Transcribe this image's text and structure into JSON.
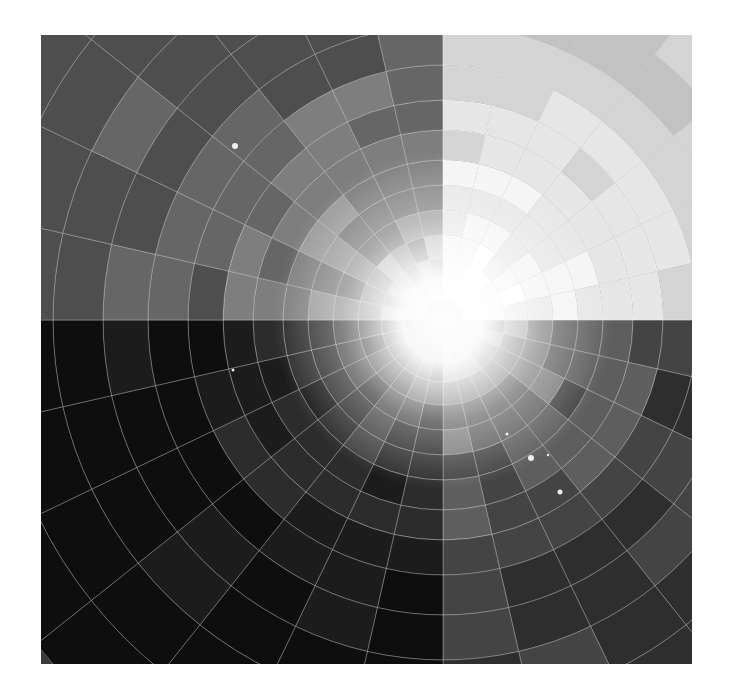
{
  "canvas": {
    "width": 729,
    "height": 700,
    "background": "#ffffff"
  },
  "artwork": {
    "frame": {
      "x": 41,
      "y": 35,
      "width": 651,
      "height": 629
    },
    "center": {
      "x": 402,
      "y": 285
    },
    "style": "grayscale radial burst with concentric segmented rings",
    "ring_radii": [
      20,
      40,
      62,
      85,
      110,
      135,
      160,
      190,
      220,
      255,
      295,
      340,
      390,
      450,
      520
    ],
    "sector_count": 28,
    "quadrant_tones": {
      "upper_right": [
        "#ffffff",
        "#f4f4f4",
        "#e6e6e6",
        "#d4d4d4",
        "#c2c2c2"
      ],
      "upper_left": [
        "#b8b8b8",
        "#9a9a9a",
        "#7e7e7e",
        "#666666",
        "#4e4e4e"
      ],
      "lower_left": [
        "#5a5a5a",
        "#404040",
        "#2c2c2c",
        "#1c1c1c",
        "#0e0e0e"
      ],
      "lower_right": [
        "#9c9c9c",
        "#7a7a7a",
        "#5e5e5e",
        "#444444",
        "#2e2e2e"
      ]
    },
    "glow_color": "#ffffff",
    "grid_line_color": "rgba(255,255,255,0.35)",
    "stars": [
      {
        "x": 235,
        "y": 146,
        "r": 3
      },
      {
        "x": 233,
        "y": 370,
        "r": 1.5
      },
      {
        "x": 531,
        "y": 458,
        "r": 3
      },
      {
        "x": 560,
        "y": 492,
        "r": 2.5
      },
      {
        "x": 507,
        "y": 434,
        "r": 1.5
      },
      {
        "x": 548,
        "y": 455,
        "r": 1.2
      }
    ]
  }
}
